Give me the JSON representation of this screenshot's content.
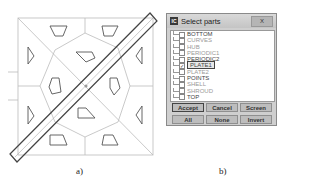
{
  "figure": {
    "caption_a": "a)",
    "caption_b": "b)"
  },
  "dialog": {
    "icon_label": "IC",
    "title": "Select parts",
    "close_label": "X",
    "parts": [
      {
        "name": "BOTTOM",
        "checked": false,
        "faded": false
      },
      {
        "name": "CURVES",
        "checked": false,
        "faded": true
      },
      {
        "name": "HUB",
        "checked": false,
        "faded": true
      },
      {
        "name": "PERIODIC1",
        "checked": false,
        "faded": true
      },
      {
        "name": "PERIODIC2",
        "checked": false,
        "faded": false
      },
      {
        "name": "PLATE1",
        "checked": true,
        "faded": false,
        "selected": true
      },
      {
        "name": "PLATE2",
        "checked": false,
        "faded": true
      },
      {
        "name": "POINTS",
        "checked": false,
        "faded": false
      },
      {
        "name": "SHELL",
        "checked": false,
        "faded": true
      },
      {
        "name": "SHROUD",
        "checked": false,
        "faded": true
      },
      {
        "name": "TOP",
        "checked": false,
        "faded": false
      }
    ],
    "buttons": {
      "accept": "Accept",
      "cancel": "Cancel",
      "screen": "Screen",
      "all": "All",
      "none": "None",
      "invert": "Invert"
    }
  }
}
